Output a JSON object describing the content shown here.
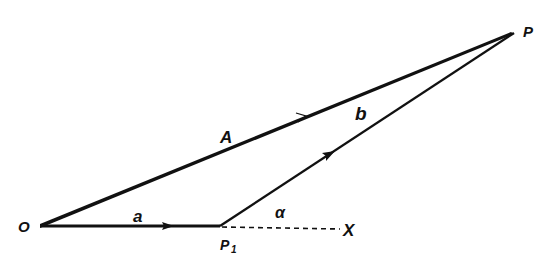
{
  "figure": {
    "points": {
      "origin": "O",
      "p1": "P",
      "p1_subscript": "1",
      "p": "P",
      "x": "X"
    },
    "vectors": {
      "a": "a",
      "b": "b",
      "A": "A"
    },
    "angle": "α",
    "stroke_color": "#111111",
    "background": "#ffffff"
  }
}
